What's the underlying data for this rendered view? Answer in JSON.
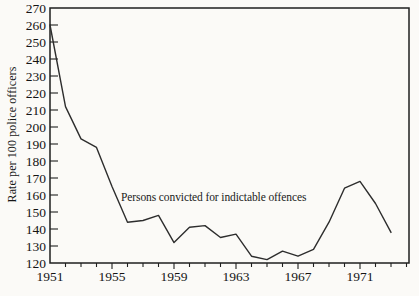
{
  "chart_data": {
    "type": "line",
    "title": "",
    "xlabel": "",
    "ylabel": "Rate per 100 police officers",
    "annotation": "Persons convicted for indictable offences",
    "x": [
      1951,
      1952,
      1953,
      1954,
      1955,
      1956,
      1957,
      1958,
      1959,
      1960,
      1961,
      1962,
      1963,
      1964,
      1965,
      1966,
      1967,
      1968,
      1969,
      1970,
      1971,
      1972,
      1973
    ],
    "values": [
      260,
      212,
      193,
      188,
      165,
      144,
      145,
      148,
      132,
      141,
      142,
      135,
      137,
      124,
      122,
      127,
      124,
      128,
      144,
      164,
      168,
      155,
      138
    ],
    "ylim": [
      120,
      270
    ],
    "ytick_step": 10,
    "xtick_labeled_years": [
      1951,
      1955,
      1959,
      1963,
      1967,
      1971
    ],
    "xtick_minor_range": [
      1951,
      1974
    ],
    "grid": "off",
    "legend": "none",
    "frame": "full-box",
    "line_color": "#2d2d2d",
    "axis_color": "#1f1f1f",
    "background_color": "#fbfaf7"
  }
}
